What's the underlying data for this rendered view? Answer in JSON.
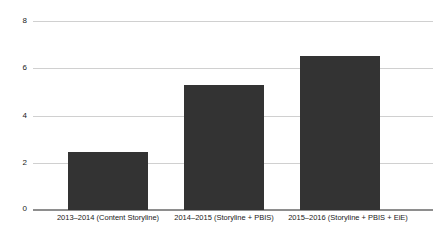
{
  "chart_data": {
    "type": "bar",
    "title": "",
    "xlabel": "",
    "ylabel": "",
    "categories": [
      "2013–2014 (Content Storyline)",
      "2014–2015 (Storyline + PBIS)",
      "2015–2016 (Storyline + PBIS + EiE)"
    ],
    "values": [
      2.45,
      5.3,
      6.55
    ],
    "ylim": [
      0,
      8
    ],
    "yticks": [
      "0",
      "2",
      "4",
      "6",
      "8"
    ],
    "ytick_values": [
      0,
      2,
      4,
      6,
      8
    ],
    "grid": true,
    "legend": "none",
    "bar_color": "#333333",
    "gridline_color": "#d0d0d0",
    "axis_color": "#8e8e8e",
    "background_color": "#ffffff"
  }
}
